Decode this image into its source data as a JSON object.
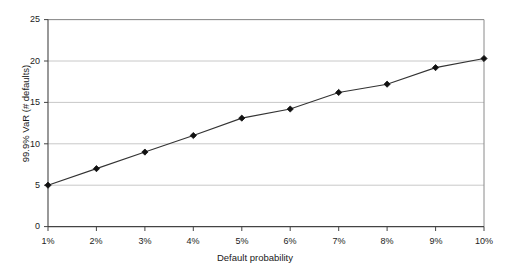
{
  "chart_data": {
    "type": "line",
    "title": "",
    "xlabel": "Default probability",
    "ylabel": "99.9% VaR (# defaults)",
    "categories": [
      "1%",
      "2%",
      "3%",
      "4%",
      "5%",
      "6%",
      "7%",
      "8%",
      "9%",
      "10%"
    ],
    "x": [
      1,
      2,
      3,
      4,
      5,
      6,
      7,
      8,
      9,
      10
    ],
    "values": [
      5.0,
      7.0,
      9.0,
      11.0,
      13.1,
      14.2,
      16.2,
      17.2,
      19.2,
      20.3
    ],
    "series": [
      {
        "name": "99.9% VaR",
        "values": [
          5.0,
          7.0,
          9.0,
          11.0,
          13.1,
          14.2,
          16.2,
          17.2,
          19.2,
          20.3
        ],
        "marker": "diamond",
        "line_color": "#333333",
        "marker_color": "#111111"
      }
    ],
    "ylim": [
      0,
      25
    ],
    "yticks": [
      0,
      5,
      10,
      15,
      20,
      25
    ],
    "ytick_labels": [
      "0",
      "5",
      "10",
      "15",
      "20",
      "25"
    ],
    "xtick_labels": [
      "1%",
      "2%",
      "3%",
      "4%",
      "5%",
      "6%",
      "7%",
      "8%",
      "9%",
      "10%"
    ],
    "grid": {
      "horizontal": true,
      "vertical": false,
      "color": "#c8c8c8"
    },
    "legend": {
      "visible": false,
      "position": "none"
    },
    "plot_border_color": "#6e6e6e",
    "background": "#ffffff"
  },
  "axes": {
    "y_title": "99.9% VaR (# defaults)",
    "x_title": "Default probability"
  }
}
